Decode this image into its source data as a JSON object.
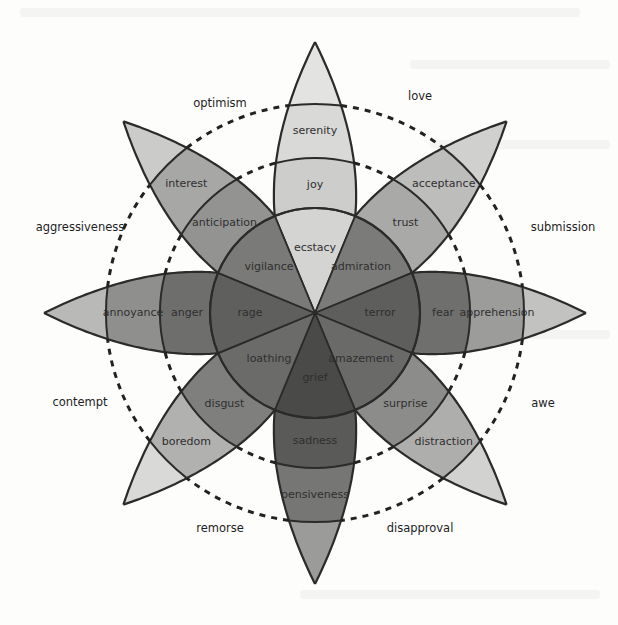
{
  "diagram": {
    "center": [
      315,
      313
    ],
    "radii": {
      "inner": 105,
      "middle": 155,
      "outer": 209,
      "tip": 271
    },
    "dashed_radii": [
      155,
      209
    ],
    "petals": [
      {
        "angle": -90,
        "primary": "joy",
        "intense": "ecstacy",
        "mild": "serenity",
        "tones": [
          "#d4d4d2",
          "#cdcdcb",
          "#d9d9d7",
          "#e3e3e1"
        ]
      },
      {
        "angle": -45,
        "primary": "trust",
        "intense": "admiration",
        "mild": "acceptance",
        "tones": [
          "#7b7b79",
          "#a9a9a7",
          "#bdbdbb",
          "#d0d0ce"
        ]
      },
      {
        "angle": 0,
        "primary": "fear",
        "intense": "terror",
        "mild": "apprehension",
        "tones": [
          "#5e5e5c",
          "#6f6f6d",
          "#9c9c9a",
          "#c2c2c0"
        ]
      },
      {
        "angle": 45,
        "primary": "surprise",
        "intense": "amazement",
        "mild": "distraction",
        "tones": [
          "#6a6a68",
          "#8c8c8a",
          "#aeaeac",
          "#d2d2d0"
        ]
      },
      {
        "angle": 90,
        "primary": "sadness",
        "intense": "grief",
        "mild": "pensiveness",
        "tones": [
          "#4a4a48",
          "#5a5a58",
          "#767674",
          "#9b9b99"
        ]
      },
      {
        "angle": 135,
        "primary": "disgust",
        "intense": "loathing",
        "mild": "boredom",
        "tones": [
          "#6b6b69",
          "#7f7f7d",
          "#b1b1af",
          "#d9d9d7"
        ]
      },
      {
        "angle": 180,
        "primary": "anger",
        "intense": "rage",
        "mild": "annoyance",
        "tones": [
          "#5f5f5d",
          "#6e6e6c",
          "#8f8f8d",
          "#b9b9b7"
        ]
      },
      {
        "angle": -135,
        "primary": "anticipation",
        "intense": "vigilance",
        "mild": "interest",
        "tones": [
          "#7a7a78",
          "#939391",
          "#a7a7a5",
          "#cbcbc9"
        ]
      }
    ],
    "dyads": [
      {
        "label": "love",
        "x": 420,
        "y": 96
      },
      {
        "label": "submission",
        "x": 563,
        "y": 227
      },
      {
        "label": "awe",
        "x": 543,
        "y": 403
      },
      {
        "label": "disapproval",
        "x": 420,
        "y": 528
      },
      {
        "label": "remorse",
        "x": 220,
        "y": 528
      },
      {
        "label": "contempt",
        "x": 80,
        "y": 402
      },
      {
        "label": "aggressiveness",
        "x": 80,
        "y": 227
      },
      {
        "label": "optimism",
        "x": 220,
        "y": 103
      }
    ],
    "label_radii": {
      "intense": 65,
      "primary": 128,
      "mild": 182
    }
  }
}
